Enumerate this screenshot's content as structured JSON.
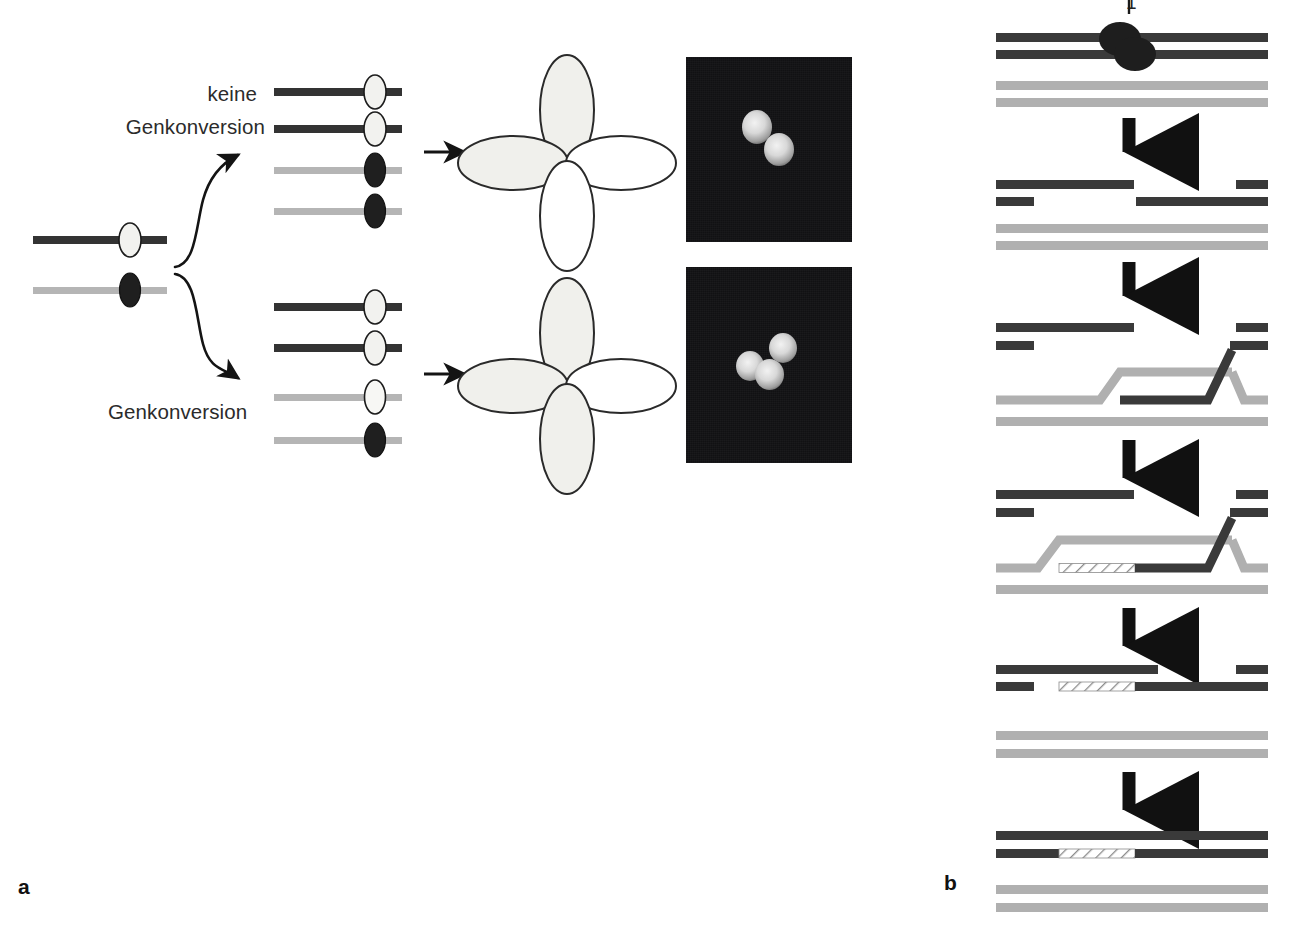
{
  "figure": {
    "panels": [
      {
        "id": "a",
        "label": "a"
      },
      {
        "id": "b",
        "label": "b"
      }
    ]
  },
  "panel_a": {
    "labels": {
      "no_conversion_line1": "keine",
      "no_conversion_line2": "Genkonversion",
      "conversion": "Genkonversion"
    },
    "parental": {
      "name": "parental-chromatids",
      "chromatids": [
        {
          "strand_color": "#333333",
          "marker": "white-allele",
          "marker_fill": "#f2f2ef"
        },
        {
          "strand_color": "#b5b5b5",
          "marker": "dark-allele",
          "marker_fill": "#1f1f1f"
        }
      ]
    },
    "outcome_no_conversion": {
      "name": "tetrad-2-2-segregation",
      "ratio": "2:2",
      "chromatids": [
        {
          "strand_color": "#333333",
          "marker_fill": "#f2f2ef"
        },
        {
          "strand_color": "#333333",
          "marker_fill": "#f2f2ef"
        },
        {
          "strand_color": "#b5b5b5",
          "marker_fill": "#1f1f1f"
        },
        {
          "strand_color": "#b5b5b5",
          "marker_fill": "#1f1f1f"
        }
      ],
      "tetrad_lobes": [
        {
          "position": "top",
          "filled": true
        },
        {
          "position": "left",
          "filled": true
        },
        {
          "position": "right",
          "filled": false
        },
        {
          "position": "bottom",
          "filled": false
        }
      ],
      "micrograph": {
        "bright_spores": 2,
        "background": "#111113"
      }
    },
    "outcome_conversion": {
      "name": "tetrad-3-1-segregation",
      "ratio": "3:1",
      "chromatids": [
        {
          "strand_color": "#333333",
          "marker_fill": "#f2f2ef"
        },
        {
          "strand_color": "#333333",
          "marker_fill": "#f2f2ef"
        },
        {
          "strand_color": "#b5b5b5",
          "marker_fill": "#f2f2ef"
        },
        {
          "strand_color": "#b5b5b5",
          "marker_fill": "#1f1f1f"
        }
      ],
      "tetrad_lobes": [
        {
          "position": "top",
          "filled": true
        },
        {
          "position": "left",
          "filled": true
        },
        {
          "position": "bottom",
          "filled": true
        },
        {
          "position": "right",
          "filled": false
        }
      ],
      "micrograph": {
        "bright_spores": 3,
        "background": "#111113"
      }
    }
  },
  "panel_b": {
    "steps": [
      {
        "num": "1",
        "name": "double-strand-break-formation"
      },
      {
        "num": "2",
        "name": "end-resection"
      },
      {
        "num": "3",
        "name": "strand-invasion-d-loop"
      },
      {
        "num": "4",
        "name": "dna-synthesis"
      },
      {
        "num": "5",
        "name": "strand-displacement-annealing"
      },
      {
        "num": "6",
        "name": "ligation-repaired-duplex"
      }
    ],
    "colors": {
      "broken_duplex": "#3a3a3a",
      "template_duplex": "#b0b0b0",
      "new_synthesis_hatch": "#ffffff",
      "break_protein": "#1e1e1e",
      "arrow": "#111111"
    }
  }
}
